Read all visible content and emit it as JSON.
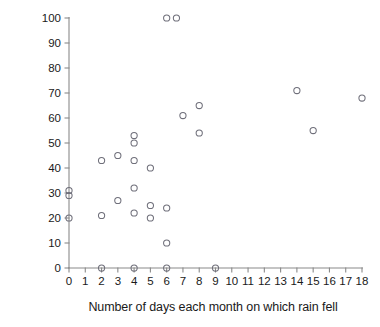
{
  "chart_data": {
    "type": "scatter",
    "title": "",
    "xlabel": "Number of days each month on which rain fell",
    "ylabel": "% mantids that were green",
    "xlim": [
      0,
      18
    ],
    "ylim": [
      0,
      100
    ],
    "xticks": [
      0,
      1,
      2,
      3,
      4,
      5,
      6,
      7,
      8,
      9,
      10,
      11,
      12,
      13,
      14,
      15,
      16,
      17,
      18
    ],
    "yticks": [
      0,
      10,
      20,
      30,
      40,
      50,
      60,
      70,
      80,
      90,
      100
    ],
    "xtick_labels": [
      "0",
      "1",
      "2",
      "3",
      "4",
      "5",
      "6",
      "7",
      "8",
      "9",
      "10",
      "11",
      "12",
      "13",
      "14",
      "15",
      "16",
      "17",
      "18"
    ],
    "ytick_labels": [
      "0",
      "10",
      "20",
      "30",
      "40",
      "50",
      "60",
      "70",
      "80",
      "90",
      "100"
    ],
    "grid": false,
    "legend": null,
    "marker": "open-circle",
    "marker_color": "#6f6f7a",
    "points": [
      {
        "x": 0,
        "y": 20
      },
      {
        "x": 0,
        "y": 29
      },
      {
        "x": 0,
        "y": 31
      },
      {
        "x": 2,
        "y": 0
      },
      {
        "x": 2,
        "y": 21
      },
      {
        "x": 2,
        "y": 43
      },
      {
        "x": 3,
        "y": 27
      },
      {
        "x": 3,
        "y": 45
      },
      {
        "x": 4,
        "y": 0
      },
      {
        "x": 4,
        "y": 22
      },
      {
        "x": 4,
        "y": 32
      },
      {
        "x": 4,
        "y": 43
      },
      {
        "x": 4,
        "y": 50
      },
      {
        "x": 4,
        "y": 53
      },
      {
        "x": 5,
        "y": 20
      },
      {
        "x": 5,
        "y": 25
      },
      {
        "x": 5,
        "y": 40
      },
      {
        "x": 6,
        "y": 0
      },
      {
        "x": 6,
        "y": 10
      },
      {
        "x": 6,
        "y": 24
      },
      {
        "x": 6,
        "y": 100
      },
      {
        "x": 6.6,
        "y": 100
      },
      {
        "x": 7,
        "y": 61
      },
      {
        "x": 8,
        "y": 54
      },
      {
        "x": 8,
        "y": 65
      },
      {
        "x": 9,
        "y": 0
      },
      {
        "x": 14,
        "y": 71
      },
      {
        "x": 15,
        "y": 55
      },
      {
        "x": 18,
        "y": 68
      }
    ]
  }
}
